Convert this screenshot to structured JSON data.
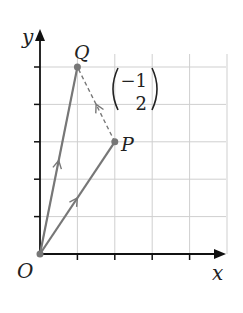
{
  "diagram": {
    "axes": {
      "x_label": "x",
      "y_label": "y",
      "origin_label": "O",
      "x_range": [
        0,
        5
      ],
      "y_range": [
        0,
        5
      ]
    },
    "points": [
      {
        "name": "O",
        "x": 0,
        "y": 0
      },
      {
        "name": "P",
        "x": 2,
        "y": 3
      },
      {
        "name": "Q",
        "x": 1,
        "y": 5
      }
    ],
    "vectors": [
      {
        "from": "O",
        "to": "P",
        "style": "solid"
      },
      {
        "from": "O",
        "to": "Q",
        "style": "solid"
      },
      {
        "from": "P",
        "to": "Q",
        "style": "dashed"
      }
    ],
    "column_vector": {
      "top": "−1",
      "bottom": "2"
    },
    "colors": {
      "grid": "#cfcfcf",
      "axis": "#111111",
      "vector": "#777777"
    }
  }
}
